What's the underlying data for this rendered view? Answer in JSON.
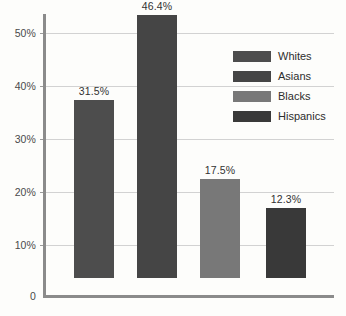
{
  "chart_data": {
    "type": "bar",
    "title": "",
    "subtitle": "",
    "xlabel": "",
    "ylabel": "",
    "categories": [
      "Whites",
      "Asians",
      "Blacks",
      "Hispanics"
    ],
    "values": [
      31.5,
      46.4,
      17.5,
      12.3
    ],
    "value_labels": [
      "31.5%",
      "46.4%",
      "17.5%",
      "12.3%"
    ],
    "ylim": [
      0,
      50
    ],
    "ytick_values": [
      0,
      10,
      20,
      30,
      40,
      50
    ],
    "ytick_labels": [
      "0",
      "10%",
      "20%",
      "30%",
      "40%",
      "50%"
    ],
    "grid": true,
    "legend_position": "top-right",
    "series": [
      {
        "name": "Whites",
        "value": 31.5,
        "label": "31.5%",
        "color": "#4d4d4d"
      },
      {
        "name": "Asians",
        "value": 46.4,
        "label": "46.4%",
        "color": "#454545"
      },
      {
        "name": "Blacks",
        "value": 17.5,
        "label": "17.5%",
        "color": "#787878"
      },
      {
        "name": "Hispanics",
        "value": 12.3,
        "label": "12.3%",
        "color": "#393939"
      }
    ]
  },
  "legend": {
    "items": [
      {
        "label": "Whites",
        "color": "#4d4d4d"
      },
      {
        "label": "Asians",
        "color": "#454545"
      },
      {
        "label": "Blacks",
        "color": "#787878"
      },
      {
        "label": "Hispanics",
        "color": "#393939"
      }
    ]
  },
  "axis": {
    "y_labels": [
      "50%",
      "40%",
      "30%",
      "20%",
      "10%",
      "0"
    ],
    "axis_color": "#8b8b8b",
    "grid_color": "#d2d2d2"
  },
  "background_color": "#fdfdfb"
}
